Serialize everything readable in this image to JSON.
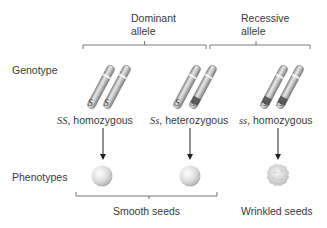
{
  "headers": {
    "dominant": {
      "line1": "Dominant",
      "line2": "allele"
    },
    "recessive": {
      "line1": "Recessive",
      "line2": "allele"
    }
  },
  "row_labels": {
    "genotype": "Genotype",
    "phenotypes": "Phenotypes"
  },
  "genotypes": [
    {
      "alleles": [
        "S",
        "S"
      ],
      "code": "SS",
      "label": ", homozygous",
      "phenotype": "smooth"
    },
    {
      "alleles": [
        "S",
        "s"
      ],
      "code": "Ss",
      "label": ", heterozygous",
      "phenotype": "smooth"
    },
    {
      "alleles": [
        "s",
        "s"
      ],
      "code": "ss",
      "label": ", homozygous",
      "phenotype": "wrinkled"
    }
  ],
  "phenotype_groups": {
    "smooth": "Smooth seeds",
    "wrinkled": "Wrinkled seeds"
  },
  "colors": {
    "chromosome": "#bdbdbd",
    "recessive_band": "#4a4a4a",
    "bracket": "#777777",
    "arrow": "#222222",
    "seed": "#d9d9d9"
  }
}
